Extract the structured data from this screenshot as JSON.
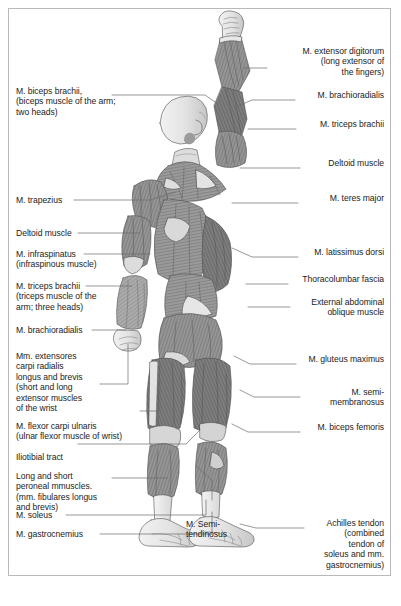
{
  "figure": {
    "view": "back",
    "style": "grayscale anatomical illustration",
    "border_color": "#b9b9b9",
    "background_color": "#ffffff",
    "ink_color": "#1c1c1c",
    "muscle_mid": "#8f8f8f",
    "muscle_dark": "#6b6b6b",
    "muscle_light": "#cfcfcf",
    "tendon_color": "#ededed"
  },
  "labels_left": [
    {
      "id": "biceps-brachii",
      "text": "M. biceps brachii,\n(biceps muscle of the arm;\n two heads)"
    },
    {
      "id": "trapezius",
      "text": "M. trapezius"
    },
    {
      "id": "deltoid-left",
      "text": "Deltoid muscle"
    },
    {
      "id": "infraspinatus",
      "text": "M. infraspinatus\n(infraspinous muscle)"
    },
    {
      "id": "triceps-brachii-left",
      "text": "M. triceps brachii\n(triceps muscle of the\narm; three heads)"
    },
    {
      "id": "brachioradialis-left",
      "text": "M. brachioradialis"
    },
    {
      "id": "extensores-carpi-radialis",
      "text": "Mm. extensores\ncarpi radialis\nlongus and brevis\n(short and long\nextensor muscles\nof the wrist"
    },
    {
      "id": "flexor-carpi-ulnaris",
      "text": "M. flexor carpi ulnaris\n(ulnar flexor muscle of wrist)"
    },
    {
      "id": "iliotibial-tract",
      "text": "Iliotibial tract"
    },
    {
      "id": "peroneal-muscles",
      "text": "Long and short\nperoneal mmuscles.\n(mm. fibulares longus\nand brevis)"
    },
    {
      "id": "soleus",
      "text": "M. soleus"
    },
    {
      "id": "gastrocnemius",
      "text": "M. gastrocnemius"
    }
  ],
  "labels_right": [
    {
      "id": "extensor-digitorum",
      "text": "M. extensor digitorum\n(long extensor of\nthe fingers)"
    },
    {
      "id": "brachioradialis-right",
      "text": "M. brachioradialis"
    },
    {
      "id": "triceps-brachii-right",
      "text": "M. triceps brachii"
    },
    {
      "id": "deltoid-right",
      "text": "Deltoid muscle"
    },
    {
      "id": "teres-major",
      "text": "M. teres major"
    },
    {
      "id": "latissimus-dorsi",
      "text": "M. latissimus dorsi"
    },
    {
      "id": "thoracolumbar-fascia",
      "text": "Thoracolumbar fascia"
    },
    {
      "id": "external-abdominal-oblique",
      "text": "External abdominal\noblique muscle"
    },
    {
      "id": "gluteus-maximus",
      "text": "M. gluteus maximus"
    },
    {
      "id": "semimembranosus",
      "text": "M. semi-\nmembranosus"
    },
    {
      "id": "biceps-femoris",
      "text": "M. biceps femoris"
    },
    {
      "id": "achilles-tendon",
      "text": "Achilles tendon\n(combined\ntendon of\nsoleus and mm.\ngastrocnemius)"
    }
  ],
  "labels_center": [
    {
      "id": "semitendinosus",
      "text": "M. Semi-\ntendinosus"
    }
  ]
}
